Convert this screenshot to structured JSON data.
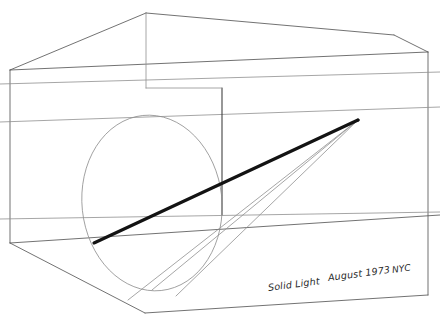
{
  "artwork": {
    "title": "Solid Light",
    "date": "August 1973",
    "place": "NYC",
    "medium_description": "line drawing",
    "background_color": "#ffffff",
    "line_color": "#555555",
    "faint_line_color": "#8d8d8d",
    "beam_color": "#111111",
    "ink_color": "#2a2a2a"
  },
  "caption": {
    "title_text": "Solid Light",
    "date_text": "August 1973",
    "place_text": "NYC",
    "full_text": "Solid Light August 1973 NYC"
  },
  "geometry": {
    "room": {
      "description": "interior perspective box",
      "front_top_left": [
        10,
        70
      ],
      "front_bottom_left": [
        10,
        243
      ],
      "front_top_right": [
        428,
        52
      ],
      "front_bottom_right": [
        428,
        295
      ],
      "back_top_left": [
        146,
        13
      ],
      "back_top_right": [
        394,
        35
      ],
      "floor_front_corner": [
        145,
        313
      ]
    },
    "light_cone": {
      "apex": [
        358,
        120
      ],
      "apex_label": "projector aperture",
      "ray_count": 3
    },
    "beam": {
      "description": "solid light beam",
      "start": [
        94,
        243
      ],
      "end": [
        358,
        120
      ],
      "stroke_width": 3.2
    },
    "ellipse": {
      "description": "elliptical light section on wall",
      "center": [
        152,
        205
      ],
      "radius_x": 70,
      "radius_y": 88,
      "rotation_deg": -6
    }
  }
}
